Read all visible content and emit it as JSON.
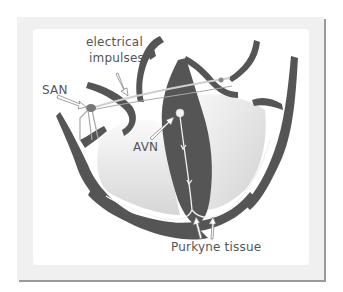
{
  "diagram": {
    "labels": {
      "electrical": "electrical",
      "impulses": "impulses",
      "san": "SAN",
      "avn": "AVN",
      "purkyne": "Purkyne tissue"
    },
    "colors": {
      "heart_wall": "#555555",
      "chamber_fill": "#e4e4e4",
      "impulse_line": "#f2f2f2",
      "pointer_fill": "#ffffff",
      "node_fill": "#777777",
      "frame": "#f0f0f0",
      "frame_shadow": "#9a9a9a",
      "text": "#555555"
    }
  }
}
